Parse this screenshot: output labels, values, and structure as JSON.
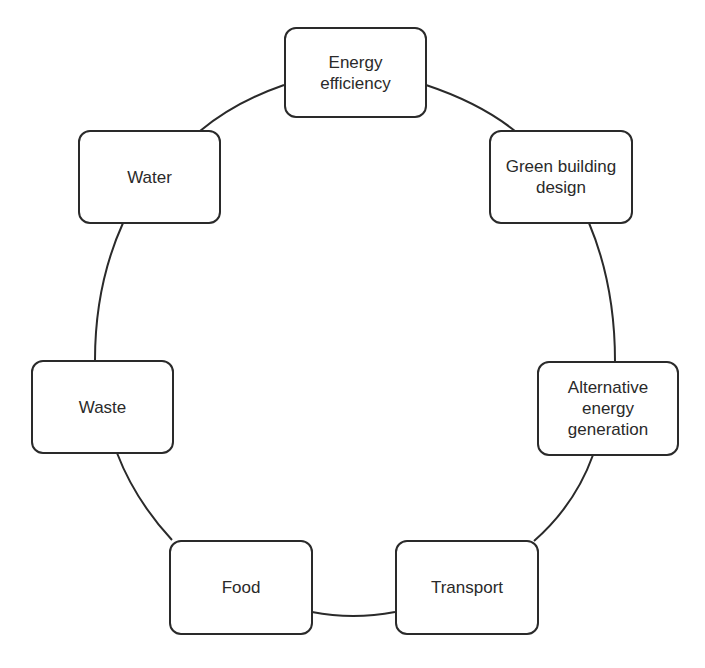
{
  "diagram": {
    "type": "cycle",
    "line_color": "#2a2a2a",
    "nodes": [
      {
        "id": "energy-efficiency",
        "label": "Energy\nefficiency"
      },
      {
        "id": "green-building-design",
        "label": "Green building\ndesign"
      },
      {
        "id": "alternative-energy-generation",
        "label": "Alternative\nenergy\ngeneration"
      },
      {
        "id": "transport",
        "label": "Transport"
      },
      {
        "id": "food",
        "label": "Food"
      },
      {
        "id": "waste",
        "label": "Waste"
      },
      {
        "id": "water",
        "label": "Water"
      }
    ]
  }
}
